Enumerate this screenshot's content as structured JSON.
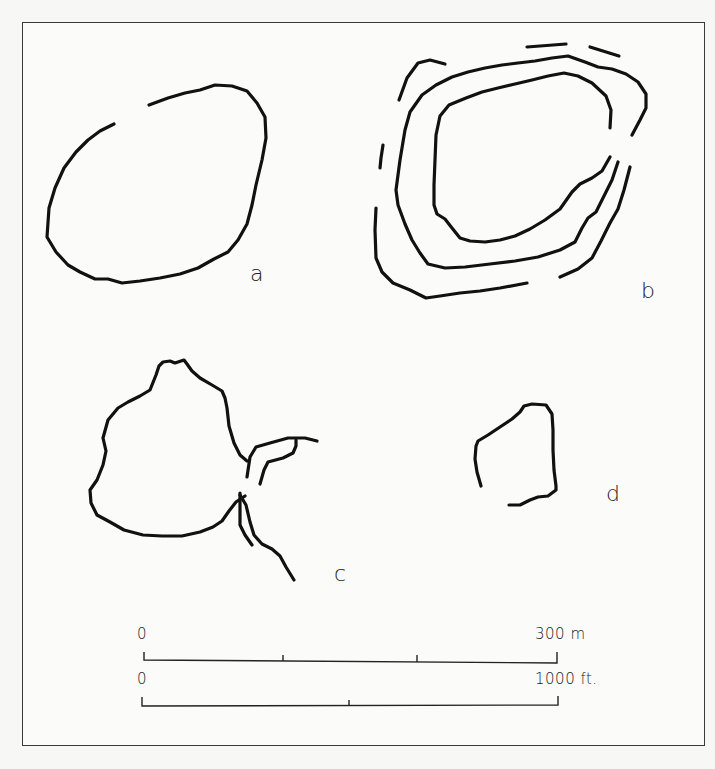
{
  "figure": {
    "shapes": [
      {
        "id": "a",
        "label": "a"
      },
      {
        "id": "b",
        "label": "b"
      },
      {
        "id": "c",
        "label": "c"
      },
      {
        "id": "d",
        "label": "d"
      }
    ],
    "scale_bars": {
      "metric": {
        "start_label": "0",
        "end_label": "300 m",
        "ticks": 3
      },
      "imperial": {
        "start_label": "0",
        "end_label": "1000 ft.",
        "ticks": 2
      }
    },
    "colors": {
      "ink": "#111111",
      "paper": "#fbfbfa",
      "frame": "#3a3a3a"
    }
  }
}
